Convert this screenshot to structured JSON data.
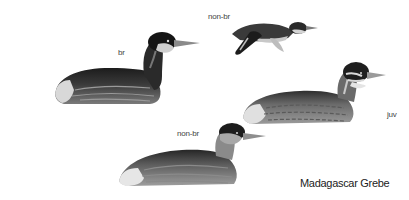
{
  "plate": {
    "species_name": "Madagascar Grebe",
    "figures": [
      {
        "id": "breeding-adult",
        "label": "br"
      },
      {
        "id": "non-breeding-flying",
        "label": "non-br"
      },
      {
        "id": "juvenile",
        "label": "juv"
      },
      {
        "id": "non-breeding-swimming",
        "label": "non-br"
      }
    ]
  },
  "colors": {
    "background": "#ffffff",
    "dark_plumage": "#1e1e1e",
    "mid_plumage": "#6a6a6a",
    "light_plumage": "#b8b8b8",
    "bill": "#8a8a8a"
  }
}
